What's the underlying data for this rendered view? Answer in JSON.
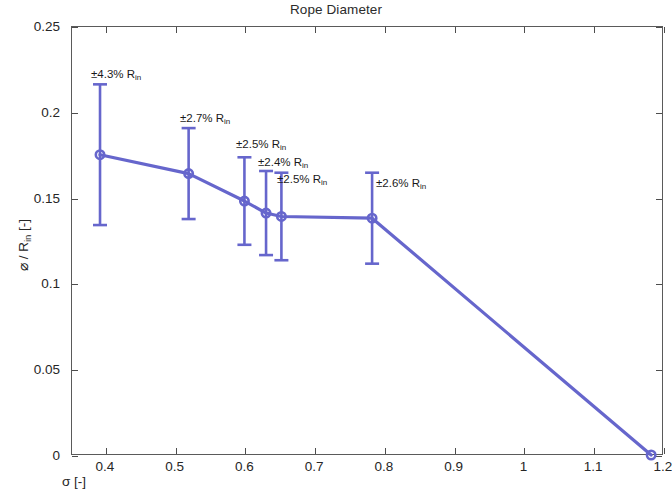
{
  "figure": {
    "title": "Rope Diameter",
    "background": "#ffffff",
    "axis_color": "#4d4d4d",
    "series_color": "#6666cc"
  },
  "axes": {
    "x": {
      "label_main": "σ",
      "label_unit": "[-]",
      "label": "σ [-]",
      "ticks": [
        "0.4",
        "0.5",
        "0.6",
        "0.7",
        "0.8",
        "0.9",
        "1",
        "1.1",
        "1.2"
      ],
      "tick_values": [
        0.4,
        0.5,
        0.6,
        0.7,
        0.8,
        0.9,
        1.0,
        1.1,
        1.2
      ],
      "min": 0.3514,
      "max": 1.2
    },
    "y": {
      "label_main": "⌀ / R",
      "label_sub": "in",
      "label_unit": "[-]",
      "label": "⌀ / R_in [-]",
      "ticks": [
        "0",
        "0.05",
        "0.1",
        "0.15",
        "0.2",
        "0.25"
      ],
      "tick_values": [
        0,
        0.05,
        0.1,
        0.15,
        0.2,
        0.25
      ],
      "min": 0,
      "max": 0.25
    }
  },
  "chart_data": {
    "type": "line",
    "title": "Rope Diameter",
    "xlabel": "σ [-]",
    "ylabel": "⌀ / R_in [-]",
    "xlim": [
      0.3514,
      1.2
    ],
    "ylim": [
      0,
      0.25
    ],
    "grid": false,
    "legend": "none",
    "marker": "circle",
    "errorbars": true,
    "series": [
      {
        "name": "Rope Diameter",
        "color": "#6666cc",
        "x": [
          0.393,
          0.52,
          0.6,
          0.631,
          0.653,
          0.783,
          1.183
        ],
        "y": [
          0.175,
          0.164,
          0.148,
          0.141,
          0.139,
          0.138,
          0.0
        ],
        "yerr": [
          0.041,
          0.0265,
          0.0255,
          0.0245,
          0.0255,
          0.0265,
          0.0
        ],
        "error_labels": [
          "±4.3% R",
          "±2.7% R",
          "±2.5% R",
          "±2.4% R",
          "±2.5% R",
          "±2.6% R",
          ""
        ],
        "error_label_sub": "in",
        "error_label_full": [
          "±4.3% R_in",
          "±2.7% R_in",
          "±2.5% R_in",
          "±2.4% R_in",
          "±2.5% R_in",
          "±2.6% R_in"
        ]
      }
    ]
  },
  "annotations": [
    {
      "text": "±4.3% R",
      "sub": "in",
      "x": 91,
      "y": 69
    },
    {
      "text": "±2.7% R",
      "sub": "in",
      "x": 180,
      "y": 113
    },
    {
      "text": "±2.5% R",
      "sub": "in",
      "x": 236,
      "y": 139
    },
    {
      "text": "±2.4% R",
      "sub": "in",
      "x": 258,
      "y": 157
    },
    {
      "text": "±2.5% R",
      "sub": "in",
      "x": 277,
      "y": 174
    },
    {
      "text": "±2.6% R",
      "sub": "in",
      "x": 376,
      "y": 178
    }
  ]
}
